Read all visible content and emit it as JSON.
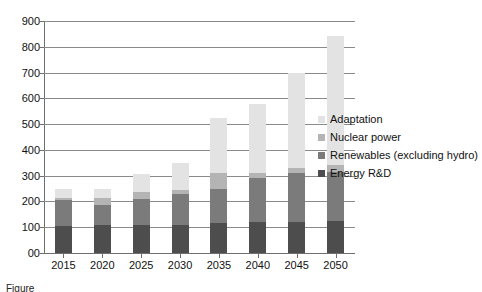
{
  "chart_data": {
    "type": "bar",
    "stacked": true,
    "title": "",
    "xlabel": "",
    "ylabel": "",
    "categories": [
      "2015",
      "2020",
      "2025",
      "2030",
      "2035",
      "2040",
      "2045",
      "2050"
    ],
    "ylim": [
      0,
      900
    ],
    "yticks": [
      0,
      100,
      200,
      300,
      400,
      500,
      600,
      700,
      800,
      900
    ],
    "ytick_labels": [
      "00",
      "100",
      "200",
      "300",
      "400",
      "500",
      "600",
      "700",
      "800",
      "900"
    ],
    "grid": true,
    "legend_position": "right",
    "series": [
      {
        "name": "Energy R&D",
        "color": "#4d4d4d",
        "values": [
          105,
          110,
          110,
          110,
          115,
          120,
          120,
          125
        ]
      },
      {
        "name": "Renewables (excluding hydro)",
        "color": "#7b7b7b",
        "values": [
          100,
          75,
          100,
          120,
          135,
          170,
          190,
          190
        ]
      },
      {
        "name": "Nuclear power",
        "color": "#b4b4b4",
        "values": [
          10,
          30,
          25,
          15,
          60,
          20,
          20,
          25
        ]
      },
      {
        "name": "Adaptation",
        "color": "#e3e3e3",
        "values": [
          35,
          35,
          70,
          105,
          215,
          270,
          370,
          500
        ]
      }
    ],
    "totals": [
      250,
      250,
      305,
      350,
      525,
      580,
      700,
      840
    ]
  },
  "legend": {
    "items": [
      {
        "label": "Adaptation",
        "color": "#e3e3e3"
      },
      {
        "label": "Nuclear power",
        "color": "#b4b4b4"
      },
      {
        "label": "Renewables (excluding hydro)",
        "color": "#7b7b7b"
      },
      {
        "label": "Energy R&D",
        "color": "#4d4d4d"
      }
    ]
  },
  "caption": {
    "text": "Figure"
  }
}
